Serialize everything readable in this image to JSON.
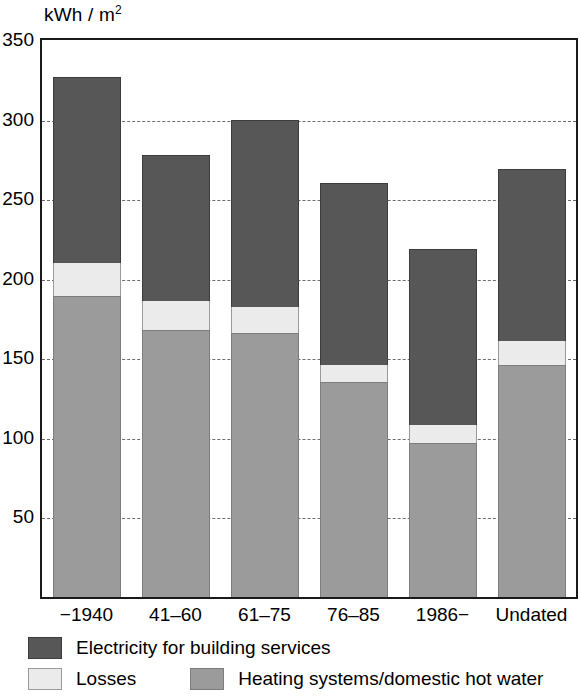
{
  "chart_data": {
    "type": "bar",
    "stacked": true,
    "title": "",
    "xlabel": "",
    "ylabel": "kWh / m²",
    "ylabel_main": "kWh / m",
    "ylabel_sup": "2",
    "ylim": [
      0,
      350
    ],
    "ytick_values": [
      50,
      100,
      150,
      200,
      250,
      300,
      350
    ],
    "ytick_labels": [
      "50",
      "100",
      "150",
      "200",
      "250",
      "300",
      "350"
    ],
    "grid": "horizontal-dashed",
    "legend_position": "below-axis",
    "categories": [
      "−1940",
      "41–60",
      "61–75",
      "76–85",
      "1986−",
      "Undated"
    ],
    "series": [
      {
        "name": "Heating systems/domestic hot water",
        "color": "#9b9b9b",
        "values": [
          189,
          168,
          166,
          135,
          97,
          146
        ]
      },
      {
        "name": "Losses",
        "color": "#ebebeb",
        "values": [
          21,
          18,
          16,
          11,
          11,
          15
        ]
      },
      {
        "name": "Electricity for building services",
        "color": "#575757",
        "values": [
          117,
          92,
          118,
          114,
          111,
          108
        ]
      }
    ],
    "totals": [
      327,
      278,
      300,
      260,
      219,
      269
    ]
  },
  "legend": {
    "electricity_label": "Electricity for building services",
    "losses_label": "Losses",
    "heating_label": "Heating systems/domestic hot water"
  }
}
